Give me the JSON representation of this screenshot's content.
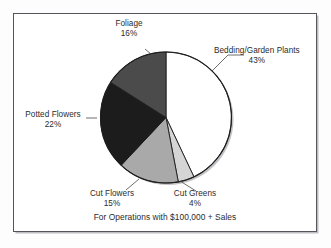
{
  "figure": {
    "caption": "For Operations with $100,000 + Sales",
    "frame_color": "#55555c",
    "background": "#ffffff"
  },
  "chart_data": {
    "type": "pie",
    "title": "",
    "subtitle": "",
    "xlabel": "",
    "ylabel": "",
    "annotations": [
      "For Operations with $100,000 + Sales"
    ],
    "legend_position": "none",
    "grid": false,
    "start_angle_deg": 0,
    "direction": "clockwise",
    "categories": [
      "Bedding/Garden Plants",
      "Cut Greens",
      "Cut Flowers",
      "Potted Flowers",
      "Foliage"
    ],
    "values": [
      43,
      4,
      15,
      22,
      16
    ],
    "units": "percent",
    "total": 100,
    "slices": [
      {
        "label": "Bedding/Garden Plants",
        "value": 43,
        "value_label": "43%",
        "color": "#ffffff",
        "stroke": "#1d1d1d"
      },
      {
        "label": "Cut Greens",
        "value": 4,
        "value_label": "4%",
        "color": "#d5d5d5",
        "stroke": "#1d1d1d"
      },
      {
        "label": "Cut Flowers",
        "value": 15,
        "value_label": "15%",
        "color": "#a9a9a9",
        "stroke": "#1d1d1d"
      },
      {
        "label": "Potted Flowers",
        "value": 22,
        "value_label": "22%",
        "color": "#1c1c1c",
        "stroke": "#1d1d1d"
      },
      {
        "label": "Foliage",
        "value": 16,
        "value_label": "16%",
        "color": "#4b4b4b",
        "stroke": "#1d1d1d"
      }
    ]
  },
  "labels": {
    "bedding": {
      "name": "Bedding/Garden Plants",
      "pct": "43%"
    },
    "foliage": {
      "name": "Foliage",
      "pct": "16%"
    },
    "potted": {
      "name": "Potted Flowers",
      "pct": "22%"
    },
    "cut_flowers": {
      "name": "Cut Flowers",
      "pct": "15%"
    },
    "cut_greens": {
      "name": "Cut Greens",
      "pct": "4%"
    }
  }
}
